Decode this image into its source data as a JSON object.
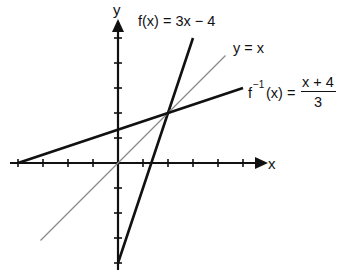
{
  "chart_data": {
    "type": "line",
    "title": "",
    "xlabel": "x",
    "ylabel": "y",
    "xlim": [
      -4.3,
      6
    ],
    "ylim": [
      -4.3,
      5.7
    ],
    "grid": false,
    "tick_spacing": 1,
    "x_ticks": [
      -4,
      -3,
      -2,
      -1,
      1,
      2,
      3,
      4,
      5
    ],
    "y_ticks": [
      -4,
      -3,
      -2,
      -1,
      1,
      2,
      3,
      4,
      5
    ],
    "series": [
      {
        "name": "f(x) = 3x − 4",
        "equation": "3x - 4",
        "style": "thick-black",
        "x": [
          0,
          3
        ],
        "y": [
          -4,
          5
        ]
      },
      {
        "name": "y = x",
        "equation": "x",
        "style": "thin-gray",
        "x": [
          -3.1,
          4.3
        ],
        "y": [
          -3.1,
          4.3
        ]
      },
      {
        "name": "f⁻¹(x) = (x + 4)/3",
        "equation": "(x + 4) / 3",
        "style": "thick-black",
        "x": [
          -4,
          5
        ],
        "y": [
          0,
          3
        ]
      }
    ],
    "annotations": {
      "intersection": [
        2,
        2
      ]
    }
  },
  "labels": {
    "x_axis": "x",
    "y_axis": "y",
    "f": "f(x) = 3x − 4",
    "identity": "y = x",
    "inverse_lhs_f": "f",
    "inverse_sup": "−1",
    "inverse_rest": "(x) =",
    "inverse_num": "x + 4",
    "inverse_den": "3"
  }
}
